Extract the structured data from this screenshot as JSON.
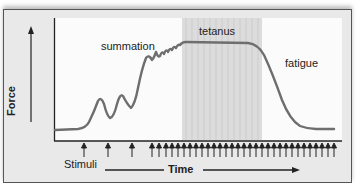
{
  "diagram": {
    "y_axis_label": "Force",
    "x_axis_label": "Time",
    "stimuli_label": "Stimuli",
    "annotations": {
      "summation": "summation",
      "tetanus": "tetanus",
      "fatigue": "fatigue"
    },
    "colors": {
      "curve": "#6e6e6e",
      "tetanus_band": "#d8d8d8",
      "frame": "#e9e9e9",
      "plot_bg": "#fbfbfb",
      "axis": "#222222"
    }
  }
}
